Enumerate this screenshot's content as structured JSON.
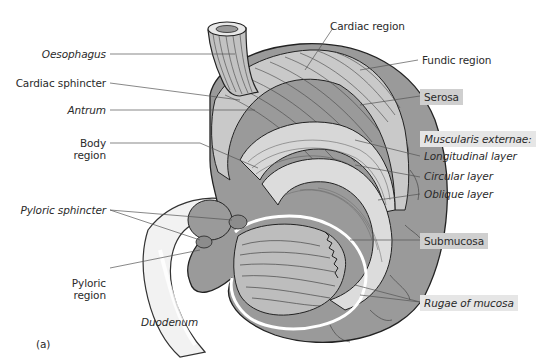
{
  "figure": {
    "panel_label": "(a)"
  },
  "labels": {
    "oesophagus": "Oesophagus",
    "cardiac_sphincter": "Cardiac sphincter",
    "antrum": "Antrum",
    "body_region_line1": "Body",
    "body_region_line2": "region",
    "pyloric_sphincter": "Pyloric sphincter",
    "pyloric_region_line1": "Pyloric",
    "pyloric_region_line2": "region",
    "duodenum": "Duodenum",
    "cardiac_region": "Cardiac region",
    "fundic_region": "Fundic region",
    "serosa": "Serosa",
    "muscularis_externae": "Muscularis externae:",
    "longitudinal_layer": "Longitudinal layer",
    "circular_layer": "Circular layer",
    "oblique_layer": "Oblique layer",
    "submucosa": "Submucosa",
    "rugae_of_mucosa": "Rugae of mucosa"
  },
  "colors": {
    "serosa_fill": "#9a9a9a",
    "muscle_fill": "#cfcfcf",
    "label_box": "#cfcfcf",
    "label_box_light": "#e6e6e6",
    "line": "#333333"
  }
}
